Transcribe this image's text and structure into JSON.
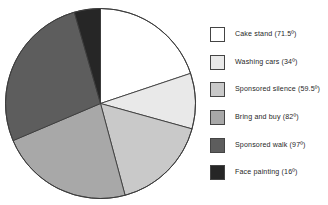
{
  "chart_data": {
    "type": "pie",
    "title": "",
    "subtitle": "",
    "xlabel": "",
    "ylabel": "",
    "legend_position": "right",
    "grid": false,
    "start_angle_deg": 0,
    "direction": "clockwise",
    "total_degrees": 360,
    "categories": [
      "Cake stand",
      "Washing cars",
      "Sponsored silence",
      "Bring and buy",
      "Sponsored walk",
      "Face painting"
    ],
    "values": [
      71.5,
      34,
      59.5,
      82,
      97,
      16
    ],
    "value_unit": "degrees",
    "slice_colors": [
      "#ffffff",
      "#e9e9e9",
      "#c9c9c9",
      "#a8a8a8",
      "#5d5d5d",
      "#262626"
    ],
    "slice_edge_color": "#3c3c3c",
    "labels_on_slices": false
  },
  "legend": {
    "items": [
      {
        "label": "Cake stand (71.5º)",
        "name": "Cake stand",
        "value": 71.5,
        "color": "#ffffff"
      },
      {
        "label": "Washing cars (34º)",
        "name": "Washing cars",
        "value": 34,
        "color": "#e9e9e9"
      },
      {
        "label": "Sponsored silence (59.5º)",
        "name": "Sponsored silence",
        "value": 59.5,
        "color": "#c9c9c9"
      },
      {
        "label": "Bring and buy (82º)",
        "name": "Bring and buy",
        "value": 82,
        "color": "#a8a8a8"
      },
      {
        "label": "Sponsored walk (97º)",
        "name": "Sponsored walk",
        "value": 97,
        "color": "#5d5d5d"
      },
      {
        "label": "Face painting (16º)",
        "name": "Face painting",
        "value": 16,
        "color": "#262626"
      }
    ]
  }
}
